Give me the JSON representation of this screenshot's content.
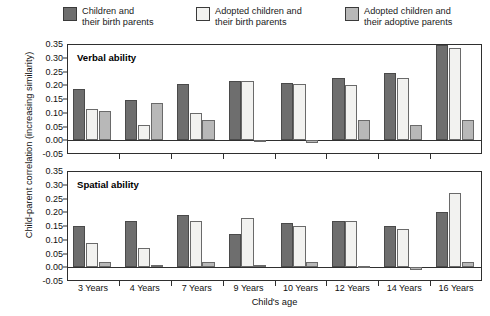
{
  "legend": {
    "items": [
      {
        "label_line1": "Children and",
        "label_line2": "their birth parents",
        "color": "#6e6e6e"
      },
      {
        "label_line1": "Adopted children and",
        "label_line2": "their birth parents",
        "color": "#f2f2f0"
      },
      {
        "label_line1": "Adopted children and",
        "label_line2": "their adoptive parents",
        "color": "#b8b8b8"
      }
    ]
  },
  "axes": {
    "ylabel": "Child-parent correlation (increasing similarity)",
    "xlabel": "Child's age",
    "yticks": [
      "0.35",
      "0.30",
      "0.25",
      "0.20",
      "0.15",
      "0.10",
      "0.05",
      "0.00",
      "-0.05"
    ]
  },
  "panels": [
    {
      "title": "Verbal ability"
    },
    {
      "title": "Spatial ability"
    }
  ],
  "chart_data": [
    {
      "type": "bar",
      "title": "Verbal ability",
      "xlabel": "Child's age",
      "ylabel": "Child-parent correlation (increasing similarity)",
      "categories": [
        "3 Years",
        "4 Years",
        "7 Years",
        "9 Years",
        "10 Years",
        "12 Years",
        "14 Years",
        "16 Years"
      ],
      "ylim": [
        -0.05,
        0.35
      ],
      "ytick_values": [
        0.35,
        0.3,
        0.25,
        0.2,
        0.15,
        0.1,
        0.05,
        0.0,
        -0.05
      ],
      "grid": false,
      "legend_position": "top",
      "series": [
        {
          "name": "Children and their birth parents",
          "color": "#6e6e6e",
          "values": [
            0.185,
            0.145,
            0.205,
            0.215,
            0.21,
            0.225,
            0.245,
            0.345
          ]
        },
        {
          "name": "Adopted children and their birth parents",
          "color": "#f2f2f0",
          "values": [
            0.115,
            0.055,
            0.1,
            0.215,
            0.205,
            0.2,
            0.225,
            0.335
          ]
        },
        {
          "name": "Adopted children and their adoptive parents",
          "color": "#b8b8b8",
          "values": [
            0.105,
            0.135,
            0.075,
            0.0,
            -0.01,
            0.075,
            0.055,
            0.075
          ]
        }
      ]
    },
    {
      "type": "bar",
      "title": "Spatial ability",
      "xlabel": "Child's age",
      "ylabel": "Child-parent correlation (increasing similarity)",
      "categories": [
        "3 Years",
        "4 Years",
        "7 Years",
        "9 Years",
        "10 Years",
        "12 Years",
        "14 Years",
        "16 Years"
      ],
      "ylim": [
        -0.05,
        0.35
      ],
      "ytick_values": [
        0.35,
        0.3,
        0.25,
        0.2,
        0.15,
        0.1,
        0.05,
        0.0,
        -0.05
      ],
      "grid": false,
      "legend_position": "top",
      "series": [
        {
          "name": "Children and their birth parents",
          "color": "#6e6e6e",
          "values": [
            0.15,
            0.17,
            0.19,
            0.12,
            0.16,
            0.17,
            0.15,
            0.2
          ]
        },
        {
          "name": "Adopted children and their birth parents",
          "color": "#f2f2f0",
          "values": [
            0.09,
            0.07,
            0.17,
            0.18,
            0.15,
            0.17,
            0.14,
            0.27
          ]
        },
        {
          "name": "Adopted children and their adoptive parents",
          "color": "#b8b8b8",
          "values": [
            0.02,
            0.01,
            0.02,
            0.01,
            0.02,
            0.005,
            -0.01,
            0.02
          ]
        }
      ]
    }
  ]
}
